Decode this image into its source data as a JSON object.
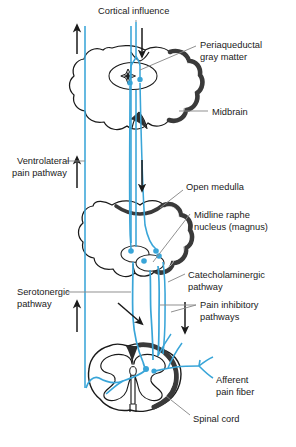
{
  "figure": {
    "title": "Cortical influence",
    "type": "neuroanatomy-pathway-diagram",
    "caption": "",
    "colors": {
      "pathway_blue": "#39a5d8",
      "outline_black": "#1a1a1a",
      "white_matter": "#3a3a3a",
      "leader_gray": "#8a8a8a",
      "text": "#1a1a1a",
      "background": "#ffffff"
    }
  },
  "labels": {
    "cortical_influence": "Cortical influence",
    "periaqueductal_gray_matter_line1": "Periaqueductal",
    "periaqueductal_gray_matter_line2": "gray matter",
    "midbrain": "Midbrain",
    "ventrolateral_pain_pathway_line1": "Ventrolateral",
    "ventrolateral_pain_pathway_line2": "pain pathway",
    "open_medulla": "Open medulla",
    "midline_raphe_line1": "Midline raphe",
    "midline_raphe_line2": "nucleus (magnus)",
    "catecholaminergic_line1": "Catecholaminergic",
    "catecholaminergic_line2": "pathway",
    "serotonergic_line1": "Serotonergic",
    "serotonergic_line2": "pathway",
    "pain_inhibitory_line1": "Pain inhibitory",
    "pain_inhibitory_line2": "pathways",
    "afferent_pain_fiber_line1": "Afferent",
    "afferent_pain_fiber_line2": "pain fiber",
    "spinal_cord": "Spinal cord"
  },
  "structures": [
    {
      "name": "midbrain",
      "label": "Midbrain",
      "region": "upper"
    },
    {
      "name": "open-medulla",
      "label": "Open medulla",
      "region": "middle"
    },
    {
      "name": "spinal-cord",
      "label": "Spinal cord",
      "region": "lower"
    }
  ],
  "nuclei": [
    {
      "name": "periaqueductal-gray-matter",
      "label": "Periaqueductal gray matter",
      "region": "midbrain"
    },
    {
      "name": "midline-raphe-nucleus-magnus",
      "label": "Midline raphe nucleus (magnus)",
      "region": "medulla"
    }
  ],
  "pathways": [
    {
      "name": "ventrolateral-pain-pathway",
      "label": "Ventrolateral pain pathway",
      "direction": "ascending"
    },
    {
      "name": "serotonergic-pathway",
      "label": "Serotonergic pathway",
      "direction": "descending"
    },
    {
      "name": "catecholaminergic-pathway",
      "label": "Catecholaminergic pathway",
      "direction": "descending"
    },
    {
      "name": "pain-inhibitory-pathways",
      "label": "Pain inhibitory pathways",
      "direction": "descending"
    },
    {
      "name": "afferent-pain-fiber",
      "label": "Afferent pain fiber",
      "direction": "afferent"
    }
  ]
}
